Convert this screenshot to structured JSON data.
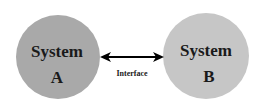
{
  "diagram": {
    "nodes": [
      {
        "id": "system-a",
        "line1": "System",
        "line2": "A",
        "color": "#a9a9a9"
      },
      {
        "id": "system-b",
        "line1": "System",
        "line2": "B",
        "color": "#c6c6c6"
      }
    ],
    "edge": {
      "label": "Interface",
      "direction": "bidirectional"
    }
  }
}
